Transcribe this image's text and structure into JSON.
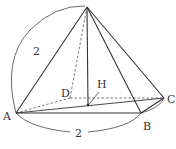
{
  "diagram": {
    "type": "square pyramid",
    "vertices": {
      "apex": {
        "label": "O",
        "x": 87,
        "y": 7
      },
      "A": {
        "label": "A",
        "x": 16,
        "y": 113
      },
      "B": {
        "label": "B",
        "x": 141,
        "y": 113
      },
      "C": {
        "label": "C",
        "x": 164,
        "y": 98
      },
      "D": {
        "label": "D",
        "x": 70,
        "y": 98
      },
      "H": {
        "label": "H",
        "x": 88,
        "y": 105
      }
    },
    "labels": {
      "A": "A",
      "B": "B",
      "C": "C",
      "D": "D",
      "H": "H",
      "edge_OA_length": "2",
      "edge_AB_length": "2"
    },
    "colors": {
      "line": "#333333",
      "background": "#ffffff"
    }
  }
}
